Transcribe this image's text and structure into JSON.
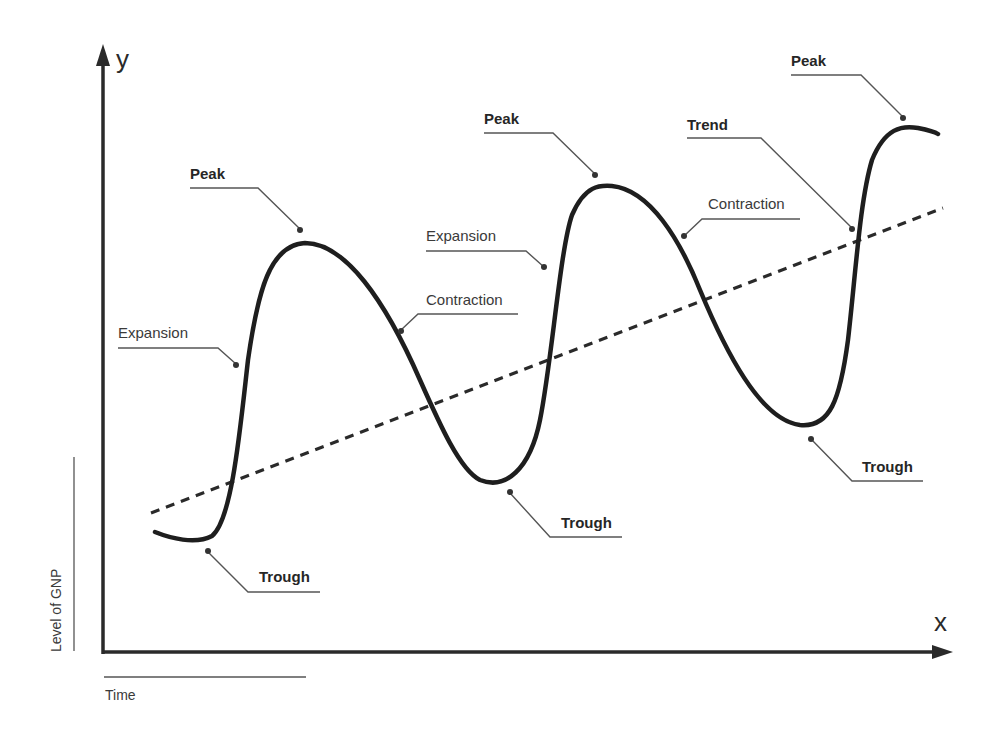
{
  "diagram": {
    "axes": {
      "y_letter": "y",
      "x_letter": "x",
      "y_title": "Level of GNP",
      "x_title": "Time"
    },
    "series": {
      "cycle_curve": "Level of GNP (business cycle)",
      "trend_line": "Trend"
    },
    "labels": {
      "peak_1": "Peak",
      "peak_2": "Peak",
      "peak_3": "Peak",
      "trough_1": "Trough",
      "trough_2": "Trough",
      "trough_3": "Trough",
      "expansion_1": "Expansion",
      "expansion_2": "Expansion",
      "contraction_1": "Contraction",
      "contraction_2": "Contraction",
      "trend": "Trend"
    },
    "colors": {
      "curve": "#1e1e1e",
      "axes": "#2a2a2a",
      "leader_lines": "#555555",
      "background": "#ffffff"
    }
  }
}
